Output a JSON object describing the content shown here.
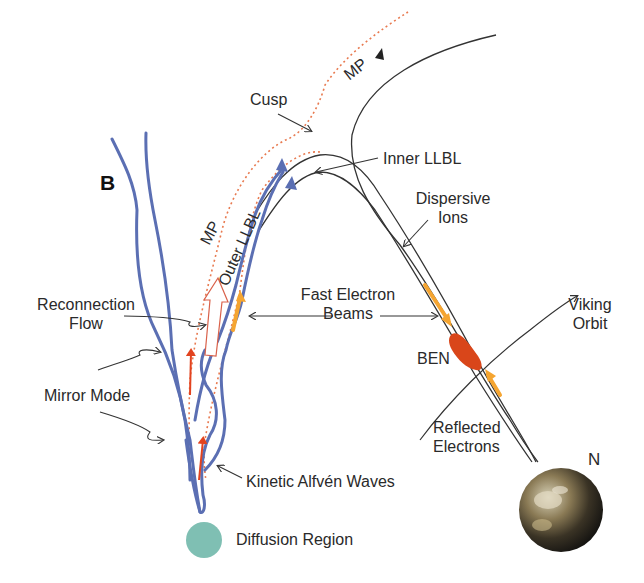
{
  "panel_label": "B",
  "labels": {
    "mp_top": "MP",
    "cusp": "Cusp",
    "inner_llbl": "Inner LLBL",
    "dispersive_ions_line1": "Dispersive",
    "dispersive_ions_line2": "Ions",
    "mp_left": "MP",
    "outer_llbl": "Outer LLBL",
    "reconnection_flow_line1": "Reconnection",
    "reconnection_flow_line2": "Flow",
    "fast_electron_beams_line1": "Fast Electron",
    "fast_electron_beams_line2": "Beams",
    "viking_orbit_line1": "Viking",
    "viking_orbit_line2": "Orbit",
    "ben": "BEN",
    "mirror_mode": "Mirror Mode",
    "reflected_electrons_line1": "Reflected",
    "reflected_electrons_line2": "Electrons",
    "north": "N",
    "kinetic_alfven_waves": "Kinetic Alfvén Waves",
    "diffusion_region": "Diffusion Region"
  },
  "colors": {
    "field_line_blue": "#5b6fb3",
    "magnetopause_dotted": "#e87a50",
    "flow_arrow_red": "#e2431f",
    "electron_beam_orange": "#f5a531",
    "ben_red": "#d9461a",
    "diffusion_region": "#7fbfb3",
    "text": "#2a2a2a"
  }
}
